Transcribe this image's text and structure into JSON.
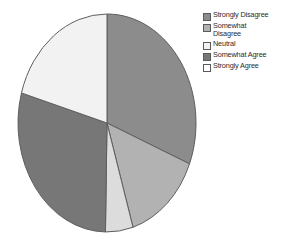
{
  "chart_data": {
    "type": "pie",
    "title": "",
    "legend_position": "right",
    "categories": [
      "Strongly Disagree",
      "Somewhat Disagree",
      "Neutral",
      "Somewhat Agree",
      "Strongly Agree"
    ],
    "values": [
      31,
      14,
      5,
      29,
      21
    ],
    "unit": "percent",
    "start_angle_deg": 0,
    "direction": "clockwise",
    "slices": [
      {
        "label": "Strongly Disagree",
        "value": 31,
        "color": "#8c8c8c",
        "start_deg": 0,
        "end_deg": 112
      },
      {
        "label": "Somewhat Disagree",
        "value": 14,
        "color": "#b2b2b2",
        "start_deg": 112,
        "end_deg": 163
      },
      {
        "label": "Neutral",
        "value": 5,
        "color": "#dcdcdc",
        "start_deg": 163,
        "end_deg": 181
      },
      {
        "label": "Somewhat Agree",
        "value": 29,
        "color": "#777777",
        "start_deg": 181,
        "end_deg": 286
      },
      {
        "label": "Strongly Agree",
        "value": 21,
        "color": "#f2f2f2",
        "start_deg": 286,
        "end_deg": 360
      }
    ],
    "geometry": {
      "cx": 107,
      "cy": 123,
      "rx": 89,
      "ry": 109
    },
    "stroke_color": "#5e5e5e"
  },
  "legend": {
    "items": [
      {
        "label": "Strongly Disagree",
        "color": "#8c8c8c"
      },
      {
        "label": "Somewhat\nDisagree",
        "color": "#b2b2b2"
      },
      {
        "label": "Neutral",
        "color": "#f2f2f2"
      },
      {
        "label": "Somewhat Agree",
        "color": "#777777"
      },
      {
        "label": "Strongly Agree",
        "color": "#ffffff"
      }
    ]
  }
}
